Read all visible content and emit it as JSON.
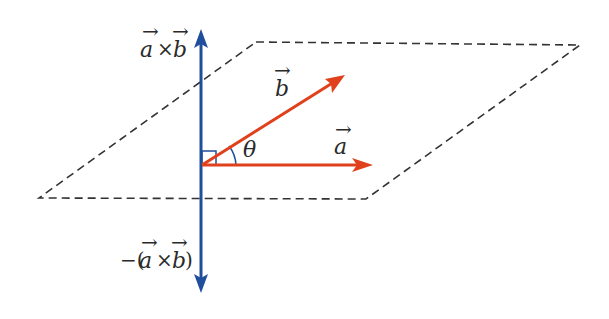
{
  "diagram": {
    "colors": {
      "normal_axis": "#1f4e9c",
      "vectors": "#e0401c",
      "plane": "#333333",
      "text": "#2a2a2a"
    },
    "labels": {
      "cross_up": {
        "a": "a",
        "times": "×",
        "b": "b"
      },
      "cross_down": {
        "minus": "−(",
        "a": "a",
        "times": "×",
        "b": "b",
        "close": ")"
      },
      "vector_a": "a",
      "vector_b": "b",
      "angle": "θ",
      "arrow_mark": "→"
    },
    "elements": {
      "plane": "dashed parallelogram",
      "normal": "vertical double-headed arrow",
      "right_angle_marker": "square at origin"
    }
  }
}
